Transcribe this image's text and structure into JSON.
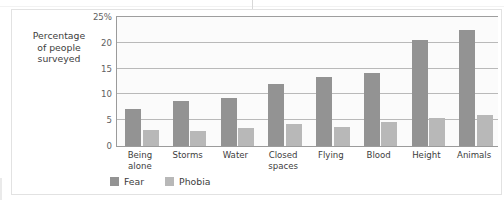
{
  "chart_data": {
    "type": "bar",
    "title": "",
    "xlabel": "",
    "ylabel": "Percentage of people surveyed",
    "ylabel_lines": [
      "Percentage",
      "of people",
      "surveyed"
    ],
    "categories": [
      "Being alone",
      "Storms",
      "Water",
      "Closed spaces",
      "Flying",
      "Blood",
      "Height",
      "Animals"
    ],
    "category_lines": [
      [
        "Being",
        "alone"
      ],
      [
        "Storms"
      ],
      [
        "Water"
      ],
      [
        "Closed",
        "spaces"
      ],
      [
        "Flying"
      ],
      [
        "Blood"
      ],
      [
        "Height"
      ],
      [
        "Animals"
      ]
    ],
    "series": [
      {
        "name": "Fear",
        "color": "#939393",
        "values": [
          7.2,
          8.7,
          9.4,
          12.0,
          13.4,
          14.2,
          20.6,
          22.5
        ]
      },
      {
        "name": "Phobia",
        "color": "#b8b8b8",
        "values": [
          3.1,
          2.9,
          3.4,
          4.3,
          3.6,
          4.7,
          5.5,
          6.0
        ]
      }
    ],
    "ylim": [
      0,
      25
    ],
    "yticks": [
      0,
      5,
      10,
      15,
      20,
      25
    ],
    "ytick_labels": [
      "0",
      "5",
      "10",
      "15",
      "20",
      "25%"
    ],
    "grid": true,
    "legend_position": "bottom-left",
    "legend_entries": [
      "Fear",
      "Phobia"
    ]
  },
  "colors": {
    "fear": "#939393",
    "phobia": "#b8b8b8",
    "gridline": "#b9b9b9",
    "axis": "#9b9b9b",
    "frame": "#e2e2e2",
    "plot_background": "#fbfbfb",
    "text": "#3d3d3d"
  }
}
